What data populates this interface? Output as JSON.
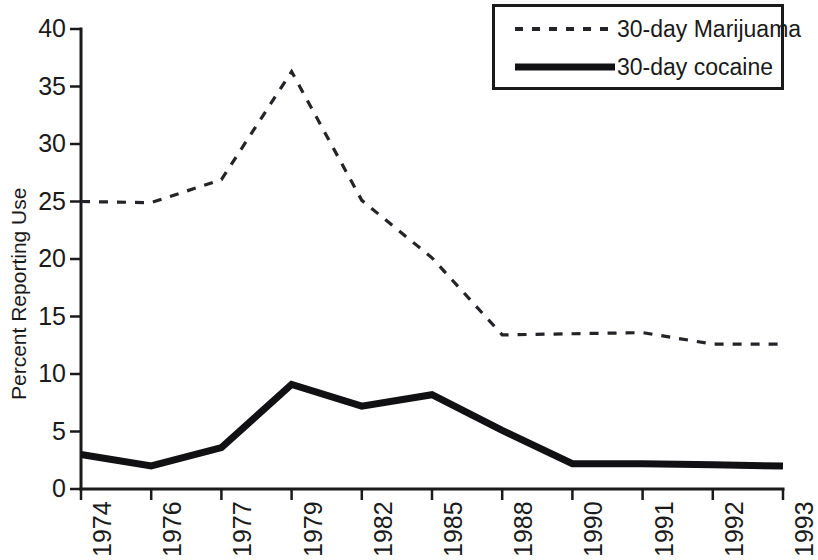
{
  "chart_data": {
    "type": "line",
    "title": "",
    "xlabel": "",
    "ylabel": "Percent Reporting Use",
    "categories": [
      "1974",
      "1976",
      "1977",
      "1979",
      "1982",
      "1985",
      "1988",
      "1990",
      "1991",
      "1992",
      "1993"
    ],
    "yticks": [
      0,
      5,
      10,
      15,
      20,
      25,
      30,
      35,
      40
    ],
    "ylim": [
      0,
      40
    ],
    "grid": false,
    "legend_position": "top-right",
    "series": [
      {
        "name": "30-day Marijuama",
        "style": "dashed",
        "values": [
          25.0,
          24.9,
          26.9,
          36.3,
          25.1,
          20.1,
          13.4,
          13.5,
          13.6,
          12.6,
          12.6
        ]
      },
      {
        "name": "30-day cocaine",
        "style": "solid",
        "values": [
          3.0,
          2.0,
          3.6,
          9.1,
          7.2,
          8.2,
          5.1,
          2.2,
          2.2,
          2.1,
          2.0
        ]
      }
    ]
  },
  "legend": {
    "entries": [
      {
        "label": "30-day Marijuama"
      },
      {
        "label": "30-day cocaine"
      }
    ]
  }
}
